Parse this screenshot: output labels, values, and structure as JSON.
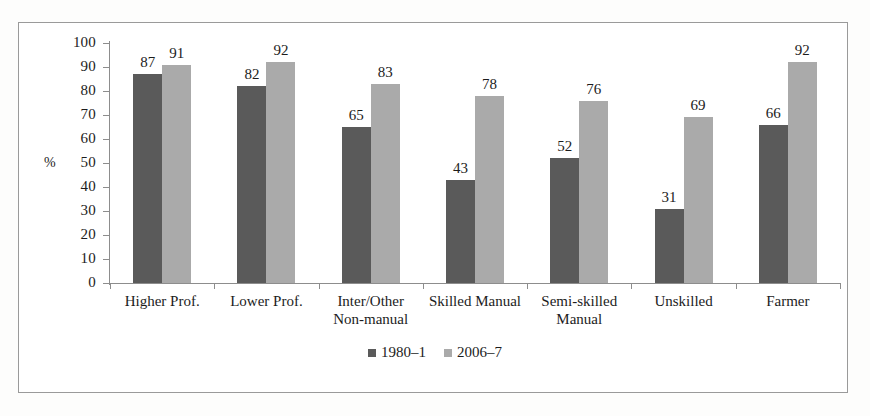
{
  "chart_data": {
    "type": "bar",
    "title": "",
    "xlabel": "",
    "ylabel": "%",
    "ylim": [
      0,
      100
    ],
    "ytick_step": 10,
    "yticks": [
      100,
      90,
      80,
      70,
      60,
      50,
      40,
      30,
      20,
      10,
      0
    ],
    "grid": false,
    "legend_position": "bottom-center",
    "categories": [
      "Higher Prof.",
      "Lower Prof.",
      "Inter/Other Non-manual",
      "Skilled Manual",
      "Semi-skilled Manual",
      "Unskilled",
      "Farmer"
    ],
    "category_lines": [
      [
        "Higher Prof.",
        ""
      ],
      [
        "Lower Prof.",
        ""
      ],
      [
        "Inter/Other",
        "Non-manual"
      ],
      [
        "Skilled Manual",
        ""
      ],
      [
        "Semi-skilled",
        "Manual"
      ],
      [
        "Unskilled",
        ""
      ],
      [
        "Farmer",
        ""
      ]
    ],
    "series": [
      {
        "name": "1980–1",
        "color": "#5a5a5a",
        "values": [
          87,
          82,
          65,
          43,
          52,
          31,
          66
        ]
      },
      {
        "name": "2006–7",
        "color": "#aaaaaa",
        "values": [
          91,
          92,
          83,
          78,
          76,
          69,
          92
        ]
      }
    ]
  },
  "colors": {
    "series_1980": "#5a5a5a",
    "series_2006": "#aaaaaa",
    "axis": "#8d8d8d",
    "frame": "#9a9a9a",
    "text": "#1c1c1c",
    "page_background": "#fdfdfc",
    "plot_background": "#ffffff"
  }
}
